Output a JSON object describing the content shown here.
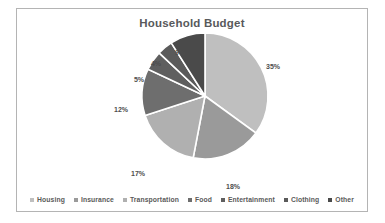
{
  "chart_data": {
    "type": "pie",
    "title": "Household Budget",
    "categories": [
      "Housing",
      "Insurance",
      "Transportation",
      "Food",
      "Entertainment",
      "Clothing",
      "Other"
    ],
    "values": [
      35,
      18,
      17,
      12,
      5,
      4,
      9
    ],
    "value_labels": [
      "35%",
      "18%",
      "17%",
      "12%",
      "5%",
      "4%",
      "9%"
    ],
    "colors": [
      "#bfbfbf",
      "#9a9a9a",
      "#b0b0b0",
      "#6e6e6e",
      "#5f5f5f",
      "#5a5a5a",
      "#4a4a4a"
    ],
    "slice_separator_color": "#ffffff",
    "start_angle_deg": 0,
    "direction": "clockwise",
    "labels_outside": true,
    "legend_position": "bottom",
    "grid": false,
    "xlabel": "",
    "ylabel": ""
  },
  "frame": {
    "border_color": "#b4b4b4",
    "background": "#ffffff"
  },
  "title": {
    "text": "Household Budget",
    "color": "#58595b"
  },
  "labels": [
    {
      "text": "35%",
      "x": 256,
      "y": 37
    },
    {
      "text": "18%",
      "x": 216,
      "y": 157
    },
    {
      "text": "17%",
      "x": 121,
      "y": 144
    },
    {
      "text": "12%",
      "x": 104,
      "y": 80
    },
    {
      "text": "5%",
      "x": 122,
      "y": 50
    },
    {
      "text": "4%",
      "x": 139,
      "y": 34
    },
    {
      "text": "9%",
      "x": 163,
      "y": 23
    }
  ],
  "legend": {
    "items": [
      {
        "label": "Housing",
        "color": "#bfbfbf"
      },
      {
        "label": "Insurance",
        "color": "#9a9a9a"
      },
      {
        "label": "Transportation",
        "color": "#b0b0b0"
      },
      {
        "label": "Food",
        "color": "#6e6e6e"
      },
      {
        "label": "Entertainment",
        "color": "#5f5f5f"
      },
      {
        "label": "Clothing",
        "color": "#5a5a5a"
      },
      {
        "label": "Other",
        "color": "#4a4a4a"
      }
    ]
  }
}
